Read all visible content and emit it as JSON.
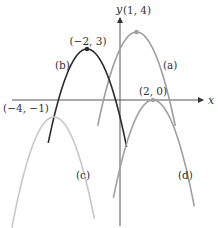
{
  "chart_data": {
    "type": "line",
    "title": "",
    "xlabel": "x",
    "ylabel": "y",
    "grid": false,
    "legend": "none (curves labeled inline)",
    "xlim": [
      -7,
      6
    ],
    "ylim": [
      -7,
      6
    ],
    "series": [
      {
        "name": "(a)",
        "vertex": [
          1,
          4
        ],
        "vertex_label": "(1, 4)",
        "label": "(a)",
        "color": "#9e9e9e",
        "a": -1,
        "x_range": [
          -1.35,
          3.35
        ],
        "label_pos": [
          163,
          69
        ],
        "vertex_label_pos": [
          137,
          14
        ]
      },
      {
        "name": "(b)",
        "vertex": [
          -2,
          3
        ],
        "vertex_label": "(−2, 3)",
        "label": "(b)",
        "color": "#2b2b2b",
        "a": -1,
        "x_range": [
          -4.35,
          0.4
        ],
        "label_pos": [
          55,
          69
        ],
        "vertex_label_pos": [
          88,
          45
        ]
      },
      {
        "name": "(c)",
        "vertex": [
          -4,
          -1
        ],
        "vertex_label": "(−4, −1)",
        "label": "(c)",
        "color": "#c8c8c8",
        "a": -1,
        "x_range": [
          -6.55,
          -1.55
        ],
        "label_pos": [
          76,
          179
        ],
        "vertex_label_pos": [
          26,
          112
        ]
      },
      {
        "name": "(d)",
        "vertex": [
          2,
          0
        ],
        "vertex_label": "(2, 0)",
        "label": "(d)",
        "color": "#a0a0a0",
        "a": -1,
        "x_range": [
          -0.4,
          4.5
        ],
        "label_pos": [
          178,
          179
        ],
        "vertex_label_pos": [
          153,
          95
        ]
      }
    ]
  },
  "axes": {
    "x_label": "x",
    "y_label": "y"
  }
}
